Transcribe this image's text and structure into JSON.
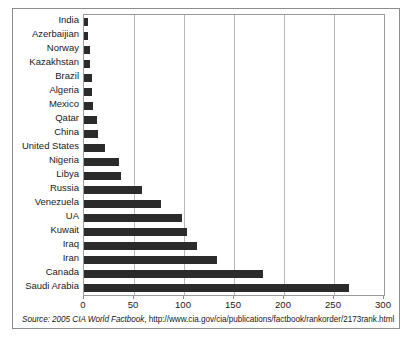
{
  "chart_data": {
    "type": "bar",
    "orientation": "horizontal",
    "title": "",
    "subtitle": "",
    "xlabel": "",
    "ylabel": "",
    "xlim": [
      0,
      300
    ],
    "xticks": [
      0,
      50,
      100,
      150,
      200,
      250,
      300
    ],
    "xtick_labels": [
      "0",
      "50",
      "100",
      "150",
      "200",
      "250",
      "300"
    ],
    "grid": true,
    "legend": false,
    "bar_color": "#2b2b2b",
    "categories": [
      "India",
      "Azerbaijian",
      "Norway",
      "Kazakhstan",
      "Brazil",
      "Algeria",
      "Mexico",
      "Qatar",
      "China",
      "United States",
      "Nigeria",
      "Libya",
      "Russia",
      "Venezuela",
      "UA",
      "Kuwait",
      "Iraq",
      "Iran",
      "Canada",
      "Saudi Arabia"
    ],
    "values": [
      4,
      4,
      6,
      6,
      8,
      8,
      9,
      13,
      14,
      21,
      35,
      37,
      58,
      77,
      98,
      103,
      113,
      133,
      179,
      265
    ]
  },
  "source": {
    "prefix": "Source: 2005 CIA World Factbook,",
    "url": "http://www.cia.gov/cia/publications/factbook/rankorder/2173rank.html",
    "full": "Source: 2005 CIA World Factbook, http://www.cia.gov/cia/publications/factbook/rankorder/2173rank.html"
  }
}
